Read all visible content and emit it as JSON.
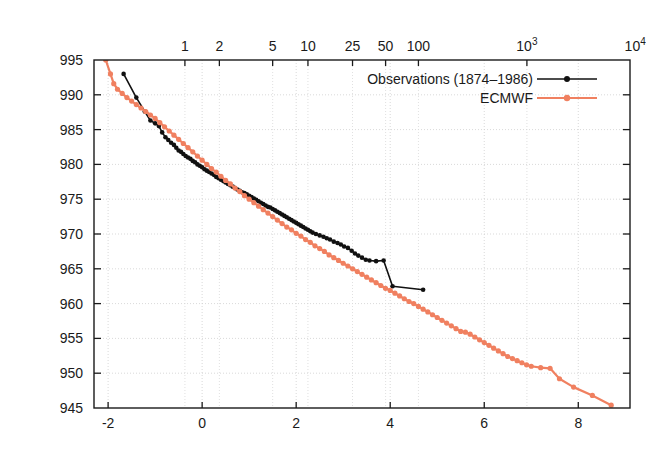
{
  "chart_data": {
    "type": "line",
    "title": "",
    "xlabel": "Gumbel variate [-]",
    "ylabel": "Daily SLP [hPa]",
    "top_xlabel": "Return period [years]",
    "xlim": [
      -2.3,
      9.1
    ],
    "ylim": [
      945,
      995
    ],
    "grid": true,
    "legend_position": "top-right",
    "xticks": [
      -2,
      0,
      2,
      4,
      6,
      8
    ],
    "xtick_labels": [
      "-2",
      "0",
      "2",
      "4",
      "6",
      "8"
    ],
    "yticks": [
      945,
      950,
      955,
      960,
      965,
      970,
      975,
      980,
      985,
      990,
      995
    ],
    "ytick_labels": [
      "945",
      "950",
      "955",
      "960",
      "965",
      "970",
      "975",
      "980",
      "985",
      "990",
      "995"
    ],
    "top_ticks": [
      {
        "label": "1",
        "sup": "",
        "gumbel": -0.3665
      },
      {
        "label": "2",
        "sup": "",
        "gumbel": 0.3665
      },
      {
        "label": "5",
        "sup": "",
        "gumbel": 1.4999
      },
      {
        "label": "10",
        "sup": "",
        "gumbel": 2.2504
      },
      {
        "label": "25",
        "sup": "",
        "gumbel": 3.1985
      },
      {
        "label": "50",
        "sup": "",
        "gumbel": 3.9019
      },
      {
        "label": "100",
        "sup": "",
        "gumbel": 4.6001
      },
      {
        "label": "10",
        "sup": "3",
        "gumbel": 6.9073
      },
      {
        "label": "10",
        "sup": "4",
        "gumbel": 9.2101
      }
    ],
    "series": [
      {
        "name": "Observations (1874–1986)",
        "color": "#111111",
        "marker": "circle",
        "points": [
          [
            -1.67,
            993.0
          ],
          [
            -1.4,
            989.6
          ],
          [
            -1.22,
            987.6
          ],
          [
            -1.1,
            986.3
          ],
          [
            -1.0,
            985.9
          ],
          [
            -0.92,
            985.5
          ],
          [
            -0.85,
            984.6
          ],
          [
            -0.78,
            983.9
          ],
          [
            -0.72,
            983.5
          ],
          [
            -0.66,
            983.1
          ],
          [
            -0.6,
            982.8
          ],
          [
            -0.55,
            982.4
          ],
          [
            -0.5,
            982.0
          ],
          [
            -0.45,
            981.8
          ],
          [
            -0.4,
            981.5
          ],
          [
            -0.35,
            981.2
          ],
          [
            -0.3,
            981.0
          ],
          [
            -0.25,
            980.8
          ],
          [
            -0.2,
            980.5
          ],
          [
            -0.15,
            980.3
          ],
          [
            -0.1,
            980.0
          ],
          [
            -0.05,
            979.8
          ],
          [
            0.0,
            979.6
          ],
          [
            0.05,
            979.3
          ],
          [
            0.1,
            979.1
          ],
          [
            0.15,
            978.9
          ],
          [
            0.2,
            978.7
          ],
          [
            0.25,
            978.5
          ],
          [
            0.3,
            978.2
          ],
          [
            0.35,
            978.0
          ],
          [
            0.4,
            977.8
          ],
          [
            0.45,
            977.6
          ],
          [
            0.5,
            977.4
          ],
          [
            0.55,
            977.2
          ],
          [
            0.6,
            977.0
          ],
          [
            0.65,
            976.8
          ],
          [
            0.7,
            976.6
          ],
          [
            0.75,
            976.4
          ],
          [
            0.8,
            976.2
          ],
          [
            0.85,
            976.0
          ],
          [
            0.9,
            975.9
          ],
          [
            0.95,
            975.7
          ],
          [
            1.0,
            975.5
          ],
          [
            1.05,
            975.3
          ],
          [
            1.1,
            975.1
          ],
          [
            1.15,
            974.9
          ],
          [
            1.2,
            974.7
          ],
          [
            1.25,
            974.5
          ],
          [
            1.3,
            974.3
          ],
          [
            1.35,
            974.1
          ],
          [
            1.4,
            973.9
          ],
          [
            1.45,
            973.8
          ],
          [
            1.5,
            973.6
          ],
          [
            1.55,
            973.4
          ],
          [
            1.6,
            973.2
          ],
          [
            1.65,
            973.0
          ],
          [
            1.7,
            972.8
          ],
          [
            1.75,
            972.6
          ],
          [
            1.8,
            972.4
          ],
          [
            1.85,
            972.2
          ],
          [
            1.9,
            972.0
          ],
          [
            1.95,
            971.8
          ],
          [
            2.0,
            971.6
          ],
          [
            2.05,
            971.4
          ],
          [
            2.1,
            971.2
          ],
          [
            2.15,
            971.0
          ],
          [
            2.2,
            970.8
          ],
          [
            2.25,
            970.6
          ],
          [
            2.3,
            970.4
          ],
          [
            2.35,
            970.2
          ],
          [
            2.42,
            970.0
          ],
          [
            2.5,
            969.8
          ],
          [
            2.58,
            969.6
          ],
          [
            2.65,
            969.4
          ],
          [
            2.72,
            969.2
          ],
          [
            2.8,
            968.9
          ],
          [
            2.88,
            968.7
          ],
          [
            2.95,
            968.5
          ],
          [
            3.02,
            968.2
          ],
          [
            3.1,
            968.0
          ],
          [
            3.18,
            967.6
          ],
          [
            3.25,
            967.2
          ],
          [
            3.32,
            966.9
          ],
          [
            3.4,
            966.6
          ],
          [
            3.48,
            966.3
          ],
          [
            3.56,
            966.2
          ],
          [
            3.7,
            966.1
          ],
          [
            3.86,
            966.2
          ],
          [
            4.05,
            962.5
          ],
          [
            4.7,
            962.0
          ]
        ]
      },
      {
        "name": "ECMWF",
        "color": "#F08060",
        "marker": "circle",
        "points": [
          [
            -2.05,
            995.0
          ],
          [
            -1.95,
            993.0
          ],
          [
            -1.88,
            991.6
          ],
          [
            -1.8,
            990.8
          ],
          [
            -1.7,
            990.2
          ],
          [
            -1.6,
            989.6
          ],
          [
            -1.5,
            989.1
          ],
          [
            -1.4,
            988.6
          ],
          [
            -1.3,
            988.1
          ],
          [
            -1.2,
            987.6
          ],
          [
            -1.1,
            987.1
          ],
          [
            -1.0,
            986.6
          ],
          [
            -0.9,
            986.0
          ],
          [
            -0.8,
            985.4
          ],
          [
            -0.7,
            984.8
          ],
          [
            -0.6,
            984.2
          ],
          [
            -0.5,
            983.6
          ],
          [
            -0.4,
            983.0
          ],
          [
            -0.3,
            982.4
          ],
          [
            -0.2,
            981.8
          ],
          [
            -0.1,
            981.2
          ],
          [
            0.0,
            980.6
          ],
          [
            0.1,
            980.0
          ],
          [
            0.2,
            979.4
          ],
          [
            0.3,
            978.9
          ],
          [
            0.4,
            978.3
          ],
          [
            0.5,
            977.7
          ],
          [
            0.6,
            977.2
          ],
          [
            0.7,
            976.6
          ],
          [
            0.8,
            976.1
          ],
          [
            0.9,
            975.5
          ],
          [
            1.0,
            975.0
          ],
          [
            1.1,
            974.5
          ],
          [
            1.2,
            974.0
          ],
          [
            1.3,
            973.5
          ],
          [
            1.4,
            973.0
          ],
          [
            1.5,
            972.5
          ],
          [
            1.6,
            972.0
          ],
          [
            1.7,
            971.5
          ],
          [
            1.8,
            971.0
          ],
          [
            1.9,
            970.6
          ],
          [
            2.0,
            970.1
          ],
          [
            2.1,
            969.7
          ],
          [
            2.2,
            969.2
          ],
          [
            2.3,
            968.8
          ],
          [
            2.4,
            968.3
          ],
          [
            2.5,
            967.9
          ],
          [
            2.6,
            967.5
          ],
          [
            2.7,
            967.0
          ],
          [
            2.8,
            966.6
          ],
          [
            2.9,
            966.2
          ],
          [
            3.0,
            965.8
          ],
          [
            3.1,
            965.4
          ],
          [
            3.2,
            965.0
          ],
          [
            3.3,
            964.6
          ],
          [
            3.4,
            964.2
          ],
          [
            3.5,
            963.8
          ],
          [
            3.6,
            963.4
          ],
          [
            3.7,
            963.0
          ],
          [
            3.8,
            962.6
          ],
          [
            3.9,
            962.2
          ],
          [
            4.0,
            961.9
          ],
          [
            4.1,
            961.5
          ],
          [
            4.2,
            961.1
          ],
          [
            4.3,
            960.7
          ],
          [
            4.4,
            960.3
          ],
          [
            4.5,
            960.0
          ],
          [
            4.6,
            959.6
          ],
          [
            4.7,
            959.2
          ],
          [
            4.8,
            958.8
          ],
          [
            4.9,
            958.4
          ],
          [
            5.0,
            958.0
          ],
          [
            5.1,
            957.6
          ],
          [
            5.2,
            957.2
          ],
          [
            5.3,
            956.8
          ],
          [
            5.4,
            956.4
          ],
          [
            5.5,
            956.0
          ],
          [
            5.6,
            955.9
          ],
          [
            5.7,
            955.6
          ],
          [
            5.8,
            955.2
          ],
          [
            5.9,
            954.8
          ],
          [
            6.0,
            954.4
          ],
          [
            6.1,
            954.0
          ],
          [
            6.2,
            953.6
          ],
          [
            6.3,
            953.2
          ],
          [
            6.4,
            952.8
          ],
          [
            6.5,
            952.4
          ],
          [
            6.6,
            952.1
          ],
          [
            6.7,
            951.8
          ],
          [
            6.8,
            951.5
          ],
          [
            6.9,
            951.2
          ],
          [
            7.0,
            951.0
          ],
          [
            7.2,
            950.8
          ],
          [
            7.4,
            950.7
          ],
          [
            7.6,
            949.2
          ],
          [
            7.9,
            948.0
          ],
          [
            8.3,
            946.8
          ],
          [
            8.7,
            945.4
          ]
        ]
      }
    ]
  }
}
